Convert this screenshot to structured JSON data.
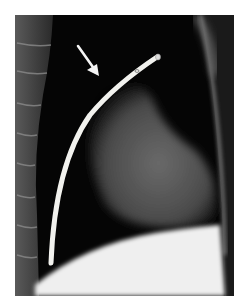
{
  "figure": {
    "type": "medical-illustration",
    "elements": [
      "spine",
      "heart-silhouette",
      "catheter",
      "arrow",
      "diaphragm",
      "chest-wall"
    ],
    "colors": {
      "background": "#ffffff",
      "frame": "#050505",
      "heart": "#5a5a5a",
      "catheter": "#f2f2ee",
      "diaphragm": "#efefef",
      "spine": "#3a3a3a"
    }
  }
}
